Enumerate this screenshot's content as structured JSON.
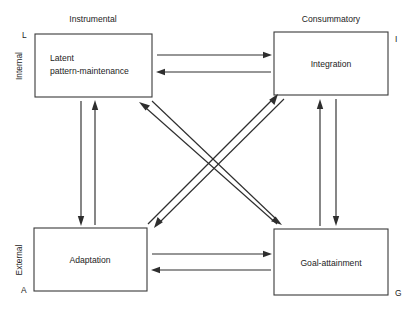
{
  "diagram": {
    "type": "agil-four-function-paradigm",
    "axis_labels": {
      "top_left": "Instrumental",
      "top_right": "Consummatory",
      "left_upper": "Internal",
      "left_lower": "External"
    },
    "corner_letters": {
      "top_left": "L",
      "top_right": "I",
      "bottom_left": "A",
      "bottom_right": "G"
    },
    "boxes": [
      {
        "id": "latent-pattern-maintenance",
        "letter": "L",
        "line1": "Latent",
        "line2": "pattern-maintenance",
        "x": 35,
        "y": 34,
        "w": 117,
        "h": 63
      },
      {
        "id": "integration",
        "letter": "I",
        "line1": "Integration",
        "line2": "",
        "x": 274,
        "y": 32,
        "w": 114,
        "h": 63
      },
      {
        "id": "adaptation",
        "letter": "A",
        "line1": "Adaptation",
        "line2": "",
        "x": 34,
        "y": 228,
        "w": 113,
        "h": 63
      },
      {
        "id": "goal-attainment",
        "letter": "G",
        "line1": "Goal-attainment",
        "line2": "",
        "x": 274,
        "y": 229,
        "w": 114,
        "h": 66
      }
    ],
    "arrows": [
      {
        "id": "L-to-I-top",
        "from": "latent-pattern-maintenance",
        "to": "integration",
        "direction": "right",
        "x1": 157,
        "y1": 55,
        "x2": 271,
        "y2": 55
      },
      {
        "id": "I-to-L-top",
        "from": "integration",
        "to": "latent-pattern-maintenance",
        "direction": "left",
        "x1": 271,
        "y1": 72,
        "x2": 157,
        "y2": 72
      },
      {
        "id": "A-to-G-bottom",
        "from": "adaptation",
        "to": "goal-attainment",
        "direction": "right",
        "x1": 152,
        "y1": 254,
        "x2": 271,
        "y2": 254
      },
      {
        "id": "G-to-A-bottom",
        "from": "goal-attainment",
        "to": "adaptation",
        "direction": "left",
        "x1": 271,
        "y1": 270,
        "x2": 152,
        "y2": 270
      },
      {
        "id": "L-to-A-left",
        "from": "latent-pattern-maintenance",
        "to": "adaptation",
        "direction": "down",
        "x1": 81,
        "y1": 101,
        "x2": 81,
        "y2": 225
      },
      {
        "id": "A-to-L-left",
        "from": "adaptation",
        "to": "latent-pattern-maintenance",
        "direction": "up",
        "x1": 95,
        "y1": 225,
        "x2": 95,
        "y2": 101
      },
      {
        "id": "G-to-I-right",
        "from": "goal-attainment",
        "to": "integration",
        "direction": "up",
        "x1": 320,
        "y1": 226,
        "x2": 320,
        "y2": 99
      },
      {
        "id": "I-to-G-right",
        "from": "integration",
        "to": "goal-attainment",
        "direction": "down",
        "x1": 336,
        "y1": 99,
        "x2": 336,
        "y2": 226
      },
      {
        "id": "G-to-L-diagonal",
        "from": "goal-attainment",
        "to": "latent-pattern-maintenance",
        "direction": "up-left",
        "x1": 277,
        "y1": 224,
        "x2": 140,
        "y2": 103
      },
      {
        "id": "L-to-G-diagonal",
        "from": "latent-pattern-maintenance",
        "to": "goal-attainment",
        "direction": "down-right",
        "x1": 152,
        "y1": 101,
        "x2": 281,
        "y2": 224
      },
      {
        "id": "A-to-I-diagonal",
        "from": "adaptation",
        "to": "integration",
        "direction": "up-right",
        "x1": 148,
        "y1": 224,
        "x2": 277,
        "y2": 95
      },
      {
        "id": "I-to-A-diagonal",
        "from": "integration",
        "to": "adaptation",
        "direction": "down-left",
        "x1": 284,
        "y1": 99,
        "x2": 155,
        "y2": 227
      }
    ]
  }
}
